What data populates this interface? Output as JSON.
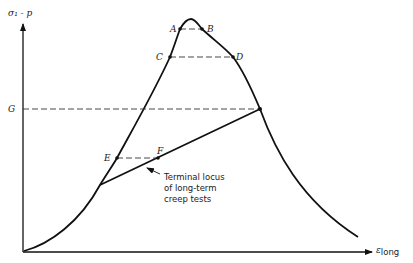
{
  "diagram": {
    "y_axis_label": "σ₁ - p",
    "x_axis_label_main": "ε",
    "x_axis_label_sub": "long",
    "points": {
      "A": "A",
      "B": "B",
      "C": "C",
      "D": "D",
      "E": "E",
      "F": "F",
      "G": "G"
    },
    "annotation": {
      "line1": "Terminal locus",
      "line2": "of long-term",
      "line3": "creep tests"
    }
  }
}
